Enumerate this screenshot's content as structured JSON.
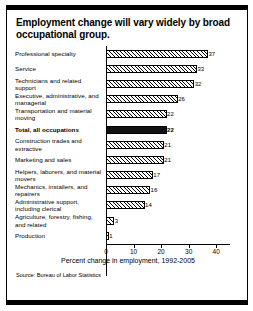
{
  "figure": {
    "title": "Employment change will vary widely by broad occupational group.",
    "source": "Source: Bureau of Labor Statistics"
  },
  "chart_data": {
    "type": "bar",
    "orientation": "horizontal",
    "title": "Employment change will vary widely by broad occupational group.",
    "xlabel": "Percent change in employment, 1992-2005",
    "ylabel": "",
    "xlim": [
      0,
      45
    ],
    "xticks": [
      0,
      10,
      20,
      30,
      40
    ],
    "xticklabels": [
      "0",
      "10",
      "20",
      "30",
      "40"
    ],
    "grid": false,
    "legend": false,
    "highlight_category": "Total, all occupations",
    "categories": [
      "Professional specialty",
      "Service",
      "Technicians and related support",
      "Executive, administrative, and managerial",
      "Transportation and material moving",
      "Total, all occupations",
      "Construction trades and extractive",
      "Marketing and sales",
      "Helpers, laborers, and material movers",
      "Mechanics, installers, and repairers",
      "Administrative support, including clerical",
      "Agriculture, forestry, fishing, and related",
      "Production"
    ],
    "values": [
      37,
      33,
      32,
      26,
      22,
      22,
      21,
      21,
      17,
      16,
      14,
      3,
      1
    ],
    "value_labels": [
      "37",
      "33",
      "32",
      "26",
      "22",
      "22",
      "21",
      "21",
      "17",
      "16",
      "14",
      "3",
      "1"
    ],
    "bars": [
      {
        "label": "Professional specialty",
        "value": 37,
        "style": "hatched"
      },
      {
        "label": "Service",
        "value": 33,
        "style": "hatched"
      },
      {
        "label": "Technicians and related support",
        "value": 32,
        "style": "hatched"
      },
      {
        "label": "Executive, administrative, and managerial",
        "value": 26,
        "style": "hatched"
      },
      {
        "label": "Transportation and material moving",
        "value": 22,
        "style": "hatched"
      },
      {
        "label": "Total, all occupations",
        "value": 22,
        "style": "solid"
      },
      {
        "label": "Construction trades and extractive",
        "value": 21,
        "style": "hatched"
      },
      {
        "label": "Marketing and sales",
        "value": 21,
        "style": "hatched"
      },
      {
        "label": "Helpers, laborers, and material movers",
        "value": 17,
        "style": "hatched"
      },
      {
        "label": "Mechanics, installers, and repairers",
        "value": 16,
        "style": "hatched"
      },
      {
        "label": "Administrative support, including clerical",
        "value": 14,
        "style": "hatched"
      },
      {
        "label": "Agriculture, forestry, fishing, and related",
        "value": 3,
        "style": "hatched"
      },
      {
        "label": "Production",
        "value": 1,
        "style": "hatched"
      }
    ],
    "colors": {
      "bar_fill": "#ffffff",
      "bar_edge": "#000000",
      "highlight_fill": "#111111",
      "background": "#ffffff",
      "text": "#000000"
    }
  }
}
